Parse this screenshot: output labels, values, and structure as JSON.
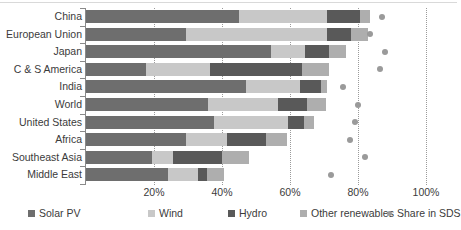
{
  "chart_data": {
    "type": "bar",
    "orientation": "horizontal",
    "stacked": true,
    "title": "",
    "xlabel": "",
    "ylabel": "",
    "xlim": [
      0,
      100
    ],
    "xticks": [
      0,
      20,
      40,
      60,
      80,
      100
    ],
    "xticklabels": [
      "",
      "20%",
      "40%",
      "60%",
      "80%",
      "100%"
    ],
    "grid": "vertical dotted gridlines at 20%, 40%, 60%, 80%, 100%",
    "legend_position": "bottom",
    "categories": [
      "China",
      "European Union",
      "Japan",
      "C & S America",
      "India",
      "World",
      "United States",
      "Africa",
      "Southeast Asia",
      "Middle East"
    ],
    "series": [
      {
        "name": "Solar PV",
        "color": "#6e6e6e",
        "values": [
          45.0,
          29.5,
          54.5,
          17.5,
          47.0,
          36.0,
          37.5,
          29.5,
          19.5,
          24.0
        ]
      },
      {
        "name": "Wind",
        "color": "#c8c8c8",
        "values": [
          26.0,
          41.5,
          10.0,
          19.0,
          16.0,
          20.5,
          22.0,
          12.0,
          6.0,
          9.0
        ]
      },
      {
        "name": "Hydro",
        "color": "#595959",
        "values": [
          9.5,
          7.0,
          7.0,
          27.0,
          6.0,
          8.5,
          4.5,
          11.5,
          14.5,
          2.5
        ]
      },
      {
        "name": "Other renewables",
        "color": "#aeaeae",
        "values": [
          3.0,
          5.0,
          5.0,
          8.0,
          2.0,
          5.5,
          3.0,
          6.0,
          8.0,
          5.0
        ]
      }
    ],
    "totals": [
      83.5,
      83.0,
      76.5,
      71.5,
      71.0,
      70.5,
      67.0,
      59.0,
      48.0,
      40.5
    ],
    "marker_series": {
      "name": "Share in SDS",
      "color": "#9a9a9a",
      "marker": "circle",
      "values": [
        87.0,
        83.5,
        88.0,
        86.5,
        75.5,
        80.0,
        79.0,
        77.5,
        82.0,
        72.0
      ]
    },
    "legend": [
      {
        "label": "Solar PV",
        "type": "swatch",
        "color": "#6e6e6e"
      },
      {
        "label": "Wind",
        "type": "swatch",
        "color": "#c8c8c8"
      },
      {
        "label": "Hydro",
        "type": "swatch",
        "color": "#595959"
      },
      {
        "label": "Other renewables",
        "type": "swatch",
        "color": "#aeaeae"
      },
      {
        "label": "Share in SDS",
        "type": "dot",
        "color": "#9a9a9a"
      }
    ]
  }
}
